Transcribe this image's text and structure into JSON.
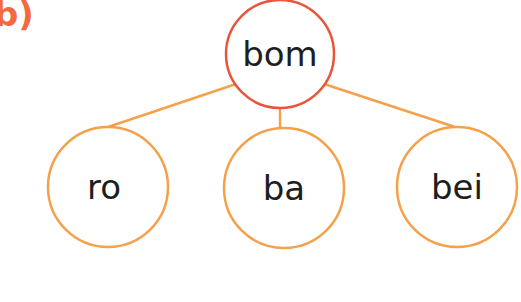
{
  "exercise_label": "b)",
  "colors": {
    "root_stroke": "#e8553a",
    "child_stroke": "#f5a04a",
    "edge": "#f5a04a",
    "label": "#f26a3f",
    "text": "#1e1e1e"
  },
  "tree": {
    "root": {
      "label": "bom",
      "cx": 280,
      "cy": 54,
      "r": 54
    },
    "children": [
      {
        "label": "ro",
        "cx": 108,
        "cy": 187,
        "r": 60
      },
      {
        "label": "ba",
        "cx": 288,
        "cy": 188,
        "r": 60
      },
      {
        "label": "bei",
        "cx": 460,
        "cy": 187,
        "r": 60
      }
    ]
  }
}
